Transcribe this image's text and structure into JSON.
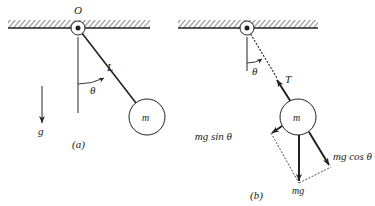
{
  "figure": {
    "panel_a": {
      "caption": "(a)",
      "pivot_label": "O",
      "length_label": "L",
      "angle_label": "θ",
      "mass_label": "m",
      "gravity_label": "g"
    },
    "panel_b": {
      "caption": "(b)",
      "angle_label": "θ",
      "tension_label": "T",
      "mass_label": "m",
      "weight_label": "mg",
      "tangential_component_label": "mg sin θ",
      "radial_component_label": "mg cos θ"
    },
    "colors": {
      "ink": "#222222",
      "background": "#ffffff"
    }
  }
}
